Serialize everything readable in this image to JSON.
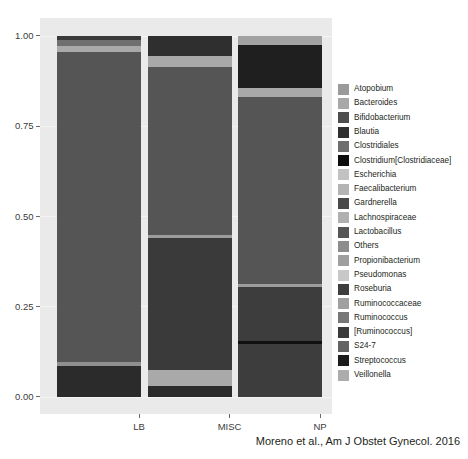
{
  "chart_data": {
    "type": "bar",
    "subtype": "stacked-bar-relative-abundance",
    "title": "",
    "xlabel": "",
    "ylabel": "",
    "categories": [
      "LB",
      "MISC",
      "NP"
    ],
    "ylim": [
      0.0,
      1.0
    ],
    "ytick_labels": [
      "0.00",
      "0.25",
      "0.50",
      "0.75",
      "1.00"
    ],
    "ytick_values": [
      0.0,
      0.25,
      0.5,
      0.75,
      1.0
    ],
    "grid": true,
    "legend_position": "right",
    "legend_title": "",
    "taxa": [
      {
        "name": "Atopobium",
        "color": "#9a9a9a"
      },
      {
        "name": "Bacteroides",
        "color": "#a8a8a8"
      },
      {
        "name": "Bifidobacterium",
        "color": "#4e4e4e"
      },
      {
        "name": "Blautia",
        "color": "#2f2f2f"
      },
      {
        "name": "Clostridiales",
        "color": "#6e6e6e"
      },
      {
        "name": "Clostridium[Clostridiaceae]",
        "color": "#0d0d0d"
      },
      {
        "name": "Escherichia",
        "color": "#c2c2c2"
      },
      {
        "name": "Faecalibacterium",
        "color": "#b4b4b4"
      },
      {
        "name": "Gardnerella",
        "color": "#4a4a4a"
      },
      {
        "name": "Lachnospiraceae",
        "color": "#b0b0b0"
      },
      {
        "name": "Lactobacillus",
        "color": "#555555"
      },
      {
        "name": "Others",
        "color": "#8d8d8d"
      },
      {
        "name": "Propionibacterium",
        "color": "#9f9f9f"
      },
      {
        "name": "Pseudomonas",
        "color": "#c8c8c8"
      },
      {
        "name": "Roseburia",
        "color": "#3d3d3d"
      },
      {
        "name": "Ruminococcaceae",
        "color": "#a0a0a0"
      },
      {
        "name": "Ruminococcus",
        "color": "#777777"
      },
      {
        "name": "[Ruminococcus]",
        "color": "#3a3a3a"
      },
      {
        "name": "S24-7",
        "color": "#636363"
      },
      {
        "name": "Streptococcus",
        "color": "#1c1c1c"
      },
      {
        "name": "Veillonella",
        "color": "#acacac"
      }
    ],
    "series": [
      {
        "name": "LB",
        "segments": [
          {
            "taxon": "Streptococcus",
            "value": 0.085,
            "color": "#2b2b2b"
          },
          {
            "taxon": "Others",
            "value": 0.012,
            "color": "#8f8f8f"
          },
          {
            "taxon": "Lactobacillus",
            "value": 0.858,
            "color": "#555555"
          },
          {
            "taxon": "Gardnerella",
            "value": 0.016,
            "color": "#a9a9a9"
          },
          {
            "taxon": "Atopobium",
            "value": 0.018,
            "color": "#6f6f6f"
          },
          {
            "taxon": "Clostridium[Clostridiaceae]",
            "value": 0.011,
            "color": "#3a3a3a"
          }
        ]
      },
      {
        "name": "MISC",
        "segments": [
          {
            "taxon": "Streptococcus",
            "value": 0.03,
            "color": "#2b2b2b"
          },
          {
            "taxon": "Escherichia",
            "value": 0.045,
            "color": "#a9a9a9"
          },
          {
            "taxon": "Lactobacillus",
            "value": 0.365,
            "color": "#3a3a3a"
          },
          {
            "taxon": "Others",
            "value": 0.008,
            "color": "#9c9c9c"
          },
          {
            "taxon": "Gardnerella",
            "value": 0.467,
            "color": "#555555"
          },
          {
            "taxon": "Propionibacterium",
            "value": 0.03,
            "color": "#a9a9a9"
          },
          {
            "taxon": "Blautia",
            "value": 0.055,
            "color": "#2f2f2f"
          }
        ]
      },
      {
        "name": "NP",
        "segments": [
          {
            "taxon": "Streptococcus",
            "value": 0.148,
            "color": "#3d3d3d"
          },
          {
            "taxon": "Clostridium[Clostridiaceae]",
            "value": 0.007,
            "color": "#101010"
          },
          {
            "taxon": "Bifidobacterium",
            "value": 0.15,
            "color": "#3d3d3d"
          },
          {
            "taxon": "Others",
            "value": 0.008,
            "color": "#9c9c9c"
          },
          {
            "taxon": "Lactobacillus",
            "value": 0.517,
            "color": "#555555"
          },
          {
            "taxon": "Pseudomonas",
            "value": 0.025,
            "color": "#a9a9a9"
          },
          {
            "taxon": "Blautia",
            "value": 0.12,
            "color": "#1f1f1f"
          },
          {
            "taxon": "Escherichia",
            "value": 0.025,
            "color": "#a2a2a2"
          }
        ]
      }
    ],
    "annotation": "Moreno et al., Am J Obstet Gynecol. 2016"
  },
  "citation": {
    "text": "Moreno et al., Am J Obstet Gynecol. 2016"
  },
  "axes": {
    "y_ticks": [
      "0.00",
      "0.25",
      "0.50",
      "0.75",
      "1.00"
    ],
    "x_ticks": [
      "LB",
      "MISC",
      "NP"
    ]
  },
  "legend": {
    "items": [
      "Atopobium",
      "Bacteroides",
      "Bifidobacterium",
      "Blautia",
      "Clostridiales",
      "Clostridium[Clostridiaceae]",
      "Escherichia",
      "Faecalibacterium",
      "Gardnerella",
      "Lachnospiraceae",
      "Lactobacillus",
      "Others",
      "Propionibacterium",
      "Pseudomonas",
      "Roseburia",
      "Ruminococcaceae",
      "Ruminococcus",
      "[Ruminococcus]",
      "S24-7",
      "Streptococcus",
      "Veillonella"
    ]
  },
  "colors": {
    "panel_background": "#eaeaea",
    "figure_background": "#ffffff",
    "gridline": "#f6f6f6",
    "text": "#231f20"
  }
}
